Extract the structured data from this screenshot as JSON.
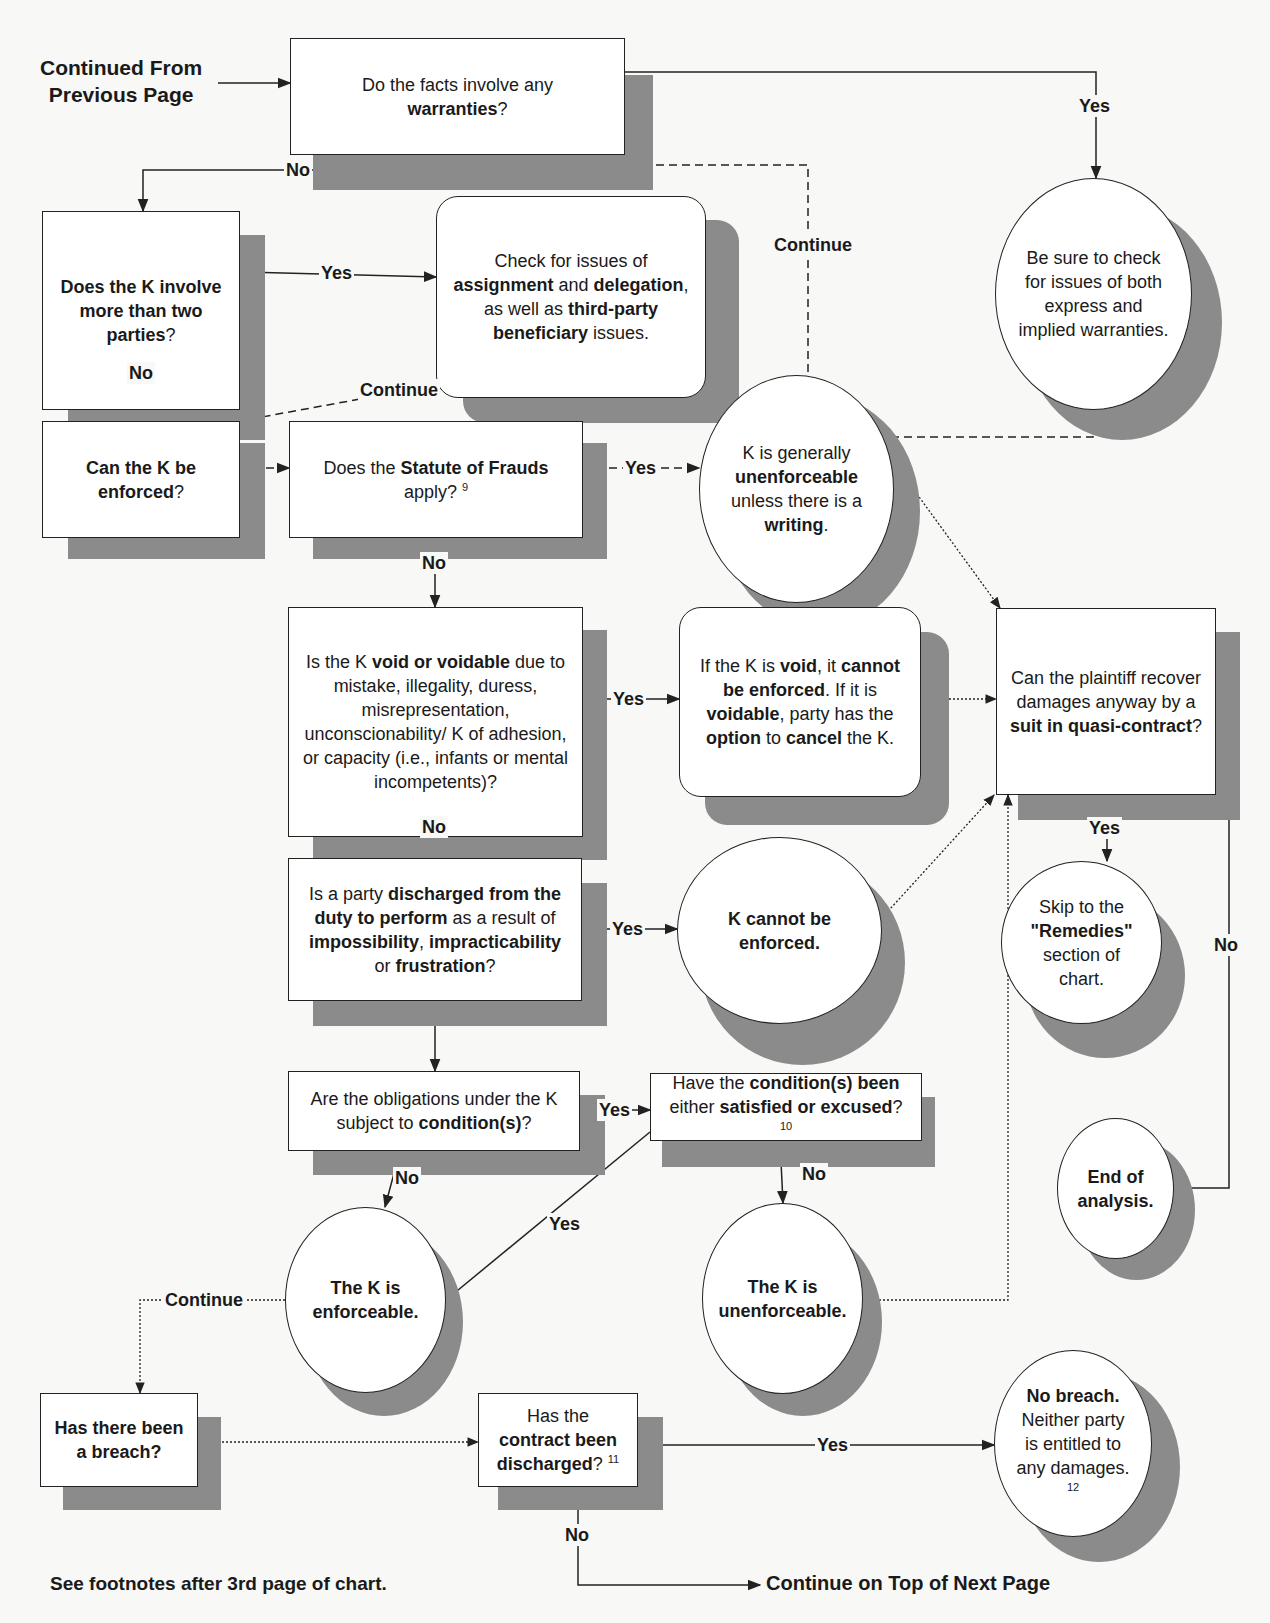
{
  "page": {
    "continued_from": [
      "Continued From",
      "Previous Page"
    ],
    "footnote_note": "See footnotes after 3rd page of chart.",
    "continue_next": "Continue on Top of Next Page"
  },
  "nodes": [
    {
      "id": "warranties",
      "shape": "rect",
      "x": 290,
      "y": 38,
      "w": 335,
      "h": 117,
      "sx": 313,
      "sy": 75,
      "sw": 340,
      "sh": 115,
      "segments": [
        [
          "",
          "Do the facts involve any "
        ],
        [
          "br",
          ""
        ],
        [
          "b",
          "warranties"
        ],
        [
          "",
          "?"
        ]
      ]
    },
    {
      "id": "check-warranties",
      "shape": "circle",
      "x": 995,
      "y": 178,
      "w": 197,
      "h": 232,
      "sx": 1022,
      "sy": 205,
      "sw": 200,
      "sh": 235,
      "segments": [
        [
          "",
          "Be sure to check for issues of both express and implied warranties."
        ]
      ]
    },
    {
      "id": "more-than-two-parties",
      "shape": "rect",
      "x": 42,
      "y": 211,
      "w": 198,
      "h": 199,
      "sx": 68,
      "sy": 235,
      "sw": 197,
      "sh": 205,
      "segments": [
        [
          "b",
          "Does the K involve more than two "
        ],
        [
          "b",
          "parties"
        ],
        [
          "",
          "?"
        ]
      ]
    },
    {
      "id": "assignment-delegation",
      "shape": "rounded",
      "x": 436,
      "y": 196,
      "w": 270,
      "h": 202,
      "sx": 463,
      "sy": 220,
      "sw": 276,
      "sh": 203,
      "segments": [
        [
          "",
          "Check for issues of "
        ],
        [
          "b",
          "assignment"
        ],
        [
          "",
          " and "
        ],
        [
          "b",
          "delegation"
        ],
        [
          "",
          ", as well as "
        ],
        [
          "b",
          "third-party beneficiary"
        ],
        [
          "",
          " issues."
        ]
      ]
    },
    {
      "id": "can-k-be-enforced",
      "shape": "rect",
      "x": 42,
      "y": 421,
      "w": 198,
      "h": 117,
      "sx": 68,
      "sy": 443,
      "sw": 197,
      "sh": 116,
      "segments": [
        [
          "b",
          "Can the K be enforced"
        ],
        [
          "",
          "?"
        ]
      ]
    },
    {
      "id": "statute-of-frauds",
      "shape": "rect",
      "x": 289,
      "y": 421,
      "w": 294,
      "h": 117,
      "sx": 313,
      "sy": 443,
      "sw": 294,
      "sh": 116,
      "segments": [
        [
          "",
          "Does the "
        ],
        [
          "b",
          "Statute of Frauds"
        ],
        [
          "",
          " apply? "
        ],
        [
          "sup",
          "9"
        ]
      ]
    },
    {
      "id": "generally-unenforceable",
      "shape": "circle",
      "x": 699,
      "y": 375,
      "w": 195,
      "h": 228,
      "sx": 720,
      "sy": 395,
      "sw": 200,
      "sh": 233,
      "segments": [
        [
          "",
          "K is generally "
        ],
        [
          "b",
          "unenforceable"
        ],
        [
          "",
          " unless there is a "
        ],
        [
          "b",
          "writing"
        ],
        [
          "",
          "."
        ]
      ]
    },
    {
      "id": "void-voidable",
      "shape": "rect",
      "x": 288,
      "y": 607,
      "w": 295,
      "h": 230,
      "sx": 313,
      "sy": 630,
      "sw": 294,
      "sh": 230,
      "segments": [
        [
          "",
          "Is the K "
        ],
        [
          "b",
          "void or voidable"
        ],
        [
          "",
          " due to mistake, illegality, duress, misrepresentation, unconscionability/ K of adhesion, or capacity (i.e., infants or mental incompetents)?"
        ]
      ]
    },
    {
      "id": "void-outcome",
      "shape": "rounded",
      "x": 679,
      "y": 607,
      "w": 242,
      "h": 190,
      "sx": 705,
      "sy": 632,
      "sw": 244,
      "sh": 193,
      "segments": [
        [
          "",
          "If the K is "
        ],
        [
          "b",
          "void"
        ],
        [
          "",
          ", it "
        ],
        [
          "b",
          "cannot be enforced"
        ],
        [
          "",
          ". If it is "
        ],
        [
          "b",
          "voidable"
        ],
        [
          "",
          ", party has the "
        ],
        [
          "b",
          "option"
        ],
        [
          "",
          " to "
        ],
        [
          "b",
          "cancel"
        ],
        [
          "",
          " the K."
        ]
      ]
    },
    {
      "id": "quasi-contract",
      "shape": "rect",
      "x": 996,
      "y": 608,
      "w": 220,
      "h": 187,
      "sx": 1018,
      "sy": 632,
      "sw": 222,
      "sh": 188,
      "segments": [
        [
          "",
          "Can the plaintiff recover damages anyway by a "
        ],
        [
          "b",
          "suit in quasi-contract"
        ],
        [
          "",
          "?"
        ]
      ]
    },
    {
      "id": "discharged-duty",
      "shape": "rect",
      "x": 288,
      "y": 858,
      "w": 294,
      "h": 143,
      "sx": 313,
      "sy": 883,
      "sw": 294,
      "sh": 143,
      "segments": [
        [
          "",
          "Is a party "
        ],
        [
          "b",
          "discharged from the duty to perform"
        ],
        [
          "",
          " as a result of "
        ],
        [
          "b",
          "impossibility"
        ],
        [
          "",
          ", "
        ],
        [
          "b",
          "impracticability"
        ],
        [
          "",
          " or "
        ],
        [
          "b",
          "frustration"
        ],
        [
          "",
          "?"
        ]
      ]
    },
    {
      "id": "cannot-be-enforced",
      "shape": "circle",
      "x": 677,
      "y": 837,
      "w": 205,
      "h": 187,
      "sx": 700,
      "sy": 860,
      "sw": 205,
      "sh": 205,
      "segments": [
        [
          "b",
          "K cannot be enforced."
        ]
      ]
    },
    {
      "id": "remedies",
      "shape": "circle",
      "x": 1001,
      "y": 861,
      "w": 161,
      "h": 163,
      "sx": 1025,
      "sy": 893,
      "sw": 160,
      "sh": 165,
      "segments": [
        [
          "",
          "Skip to the "
        ],
        [
          "b",
          "\"Remedies\""
        ],
        [
          "",
          " section of chart."
        ]
      ]
    },
    {
      "id": "conditions",
      "shape": "rect",
      "x": 288,
      "y": 1071,
      "w": 292,
      "h": 80,
      "sx": 313,
      "sy": 1095,
      "sw": 292,
      "sh": 80,
      "segments": [
        [
          "",
          "Are the obligations under the K subject to "
        ],
        [
          "b",
          "condition(s)"
        ],
        [
          "",
          "?"
        ]
      ]
    },
    {
      "id": "conditions-satisfied",
      "shape": "rect",
      "x": 650,
      "y": 1073,
      "w": 272,
      "h": 68,
      "sx": 662,
      "sy": 1097,
      "sw": 273,
      "sh": 70,
      "segments": [
        [
          "",
          "Have the "
        ],
        [
          "b",
          "condition(s) been"
        ],
        [
          "",
          " either "
        ],
        [
          "b",
          "satisfied or excused"
        ],
        [
          "",
          "? "
        ],
        [
          "sup",
          "10"
        ]
      ]
    },
    {
      "id": "end-of-analysis",
      "shape": "circle",
      "x": 1057,
      "y": 1118,
      "w": 117,
      "h": 141,
      "sx": 1078,
      "sy": 1140,
      "sw": 117,
      "sh": 140,
      "segments": [
        [
          "b",
          "End of analysis."
        ]
      ]
    },
    {
      "id": "k-enforceable",
      "shape": "circle",
      "x": 285,
      "y": 1207,
      "w": 161,
      "h": 186,
      "sx": 305,
      "sy": 1228,
      "sw": 158,
      "sh": 188,
      "segments": [
        [
          "b",
          "The K is enforceable."
        ]
      ]
    },
    {
      "id": "k-unenforceable",
      "shape": "circle",
      "x": 702,
      "y": 1203,
      "w": 161,
      "h": 191,
      "sx": 724,
      "sy": 1228,
      "sw": 158,
      "sh": 188,
      "segments": [
        [
          "b",
          "The K is unenforceable."
        ]
      ]
    },
    {
      "id": "breach",
      "shape": "rect",
      "x": 40,
      "y": 1393,
      "w": 158,
      "h": 94,
      "sx": 63,
      "sy": 1417,
      "sw": 158,
      "sh": 93,
      "segments": [
        [
          "b",
          "Has there been a breach?"
        ]
      ]
    },
    {
      "id": "contract-discharged",
      "shape": "rect",
      "x": 478,
      "y": 1393,
      "w": 160,
      "h": 94,
      "sx": 498,
      "sy": 1417,
      "sw": 165,
      "sh": 93,
      "segments": [
        [
          "",
          "Has the "
        ],
        [
          "b",
          "contract been discharged"
        ],
        [
          "",
          "? "
        ],
        [
          "sup",
          "11"
        ]
      ]
    },
    {
      "id": "no-breach",
      "shape": "circle",
      "x": 994,
      "y": 1350,
      "w": 158,
      "h": 187,
      "sx": 1018,
      "sy": 1372,
      "sw": 162,
      "sh": 190,
      "segments": [
        [
          "b",
          "No breach."
        ],
        [
          "",
          " Neither party is entitled to any damages. "
        ],
        [
          "sup",
          "12"
        ]
      ]
    }
  ],
  "edges": [
    {
      "id": "from-prev",
      "style": "solid",
      "arrow": "end",
      "points": [
        [
          218,
          83
        ],
        [
          290,
          83
        ]
      ]
    },
    {
      "id": "warranties-yes",
      "style": "solid",
      "arrow": "end",
      "points": [
        [
          625,
          72
        ],
        [
          1096,
          72
        ],
        [
          1096,
          178
        ]
      ]
    },
    {
      "id": "warranties-no",
      "style": "solid",
      "arrow": "end",
      "points": [
        [
          457,
          155
        ],
        [
          457,
          170
        ],
        [
          143,
          170
        ],
        [
          143,
          211
        ]
      ]
    },
    {
      "id": "warranty-continue",
      "style": "dashed",
      "arrow": "end",
      "points": [
        [
          1093,
          410
        ],
        [
          1093,
          437
        ],
        [
          808,
          437
        ],
        [
          808,
          165
        ],
        [
          457,
          165
        ]
      ]
    },
    {
      "id": "parties-yes",
      "style": "solid",
      "arrow": "end",
      "points": [
        [
          240,
          272
        ],
        [
          436,
          277
        ]
      ]
    },
    {
      "id": "parties-no",
      "style": "solid",
      "arrow": "end",
      "points": [
        [
          143,
          410
        ],
        [
          143,
          421
        ]
      ]
    },
    {
      "id": "assign-continue",
      "style": "dashed",
      "arrow": "end",
      "points": [
        [
          475,
          378
        ],
        [
          240,
          421
        ]
      ]
    },
    {
      "id": "enforce-to-sof",
      "style": "dashed",
      "arrow": "end",
      "points": [
        [
          240,
          468
        ],
        [
          289,
          468
        ]
      ]
    },
    {
      "id": "sof-yes",
      "style": "dashed",
      "arrow": "end",
      "points": [
        [
          583,
          468
        ],
        [
          699,
          468
        ]
      ]
    },
    {
      "id": "sof-no",
      "style": "solid",
      "arrow": "end",
      "points": [
        [
          435,
          538
        ],
        [
          435,
          607
        ]
      ]
    },
    {
      "id": "writing-to-quasi",
      "style": "dotted",
      "arrow": "end",
      "points": [
        [
          898,
          468
        ],
        [
          1000,
          608
        ]
      ]
    },
    {
      "id": "void-yes",
      "style": "solid",
      "arrow": "end",
      "points": [
        [
          583,
          699
        ],
        [
          679,
          699
        ]
      ]
    },
    {
      "id": "void-to-quasi",
      "style": "dotted",
      "arrow": "end",
      "points": [
        [
          941,
          699
        ],
        [
          996,
          699
        ]
      ]
    },
    {
      "id": "void-no",
      "style": "solid",
      "arrow": "end",
      "points": [
        [
          435,
          837
        ],
        [
          435,
          858
        ]
      ]
    },
    {
      "id": "discharge-yes",
      "style": "solid",
      "arrow": "end",
      "points": [
        [
          582,
          929
        ],
        [
          677,
          929
        ]
      ]
    },
    {
      "id": "cannot-to-quasi",
      "style": "dotted",
      "arrow": "end",
      "points": [
        [
          880,
          920
        ],
        [
          994,
          795
        ]
      ]
    },
    {
      "id": "quasi-yes",
      "style": "solid",
      "arrow": "end",
      "points": [
        [
          1107,
          795
        ],
        [
          1107,
          861
        ]
      ]
    },
    {
      "id": "quasi-no",
      "style": "solid",
      "arrow": "end",
      "points": [
        [
          1216,
          700
        ],
        [
          1229,
          700
        ],
        [
          1229,
          1188
        ],
        [
          1174,
          1188
        ]
      ]
    },
    {
      "id": "discharge-no",
      "style": "solid",
      "arrow": "end",
      "points": [
        [
          435,
          1001
        ],
        [
          435,
          1071
        ]
      ]
    },
    {
      "id": "conditions-yes",
      "style": "solid",
      "arrow": "end",
      "points": [
        [
          580,
          1110
        ],
        [
          650,
          1110
        ]
      ]
    },
    {
      "id": "conditions-no",
      "style": "solid",
      "arrow": "end",
      "points": [
        [
          400,
          1151
        ],
        [
          385,
          1207
        ]
      ]
    },
    {
      "id": "satisfied-yes",
      "style": "solid",
      "arrow": "end",
      "points": [
        [
          650,
          1132
        ],
        [
          446,
          1300
        ]
      ]
    },
    {
      "id": "satisfied-no",
      "style": "solid",
      "arrow": "end",
      "points": [
        [
          780,
          1141
        ],
        [
          783,
          1203
        ]
      ]
    },
    {
      "id": "unenforceable-to-quasi",
      "style": "dotted",
      "arrow": "end",
      "points": [
        [
          863,
          1300
        ],
        [
          1008,
          1300
        ],
        [
          1008,
          795
        ]
      ]
    },
    {
      "id": "enforceable-continue",
      "style": "dotted",
      "arrow": "end",
      "points": [
        [
          285,
          1300
        ],
        [
          140,
          1300
        ],
        [
          140,
          1393
        ]
      ]
    },
    {
      "id": "breach-to-discharged",
      "style": "dotted",
      "arrow": "end",
      "points": [
        [
          198,
          1442
        ],
        [
          478,
          1442
        ]
      ]
    },
    {
      "id": "discharged-yes",
      "style": "solid",
      "arrow": "end",
      "points": [
        [
          638,
          1445
        ],
        [
          994,
          1445
        ]
      ]
    },
    {
      "id": "discharged-no",
      "style": "solid",
      "arrow": "end",
      "points": [
        [
          578,
          1487
        ],
        [
          578,
          1585
        ],
        [
          760,
          1585
        ]
      ]
    }
  ],
  "edge_labels": [
    {
      "id": "warranties-yes",
      "text": "Yes",
      "x": 1077,
      "y": 95
    },
    {
      "id": "warranties-no",
      "text": "No",
      "x": 284,
      "y": 159
    },
    {
      "id": "warranty-continue",
      "text": "Continue",
      "x": 772,
      "y": 234
    },
    {
      "id": "parties-yes",
      "text": "Yes",
      "x": 319,
      "y": 262
    },
    {
      "id": "parties-no",
      "text": "No",
      "x": 127,
      "y": 362
    },
    {
      "id": "assign-continue",
      "text": "Continue",
      "x": 358,
      "y": 379
    },
    {
      "id": "sof-yes",
      "text": "Yes",
      "x": 623,
      "y": 457
    },
    {
      "id": "sof-no",
      "text": "No",
      "x": 420,
      "y": 552
    },
    {
      "id": "void-yes",
      "text": "Yes",
      "x": 611,
      "y": 688
    },
    {
      "id": "void-no",
      "text": "No",
      "x": 420,
      "y": 816
    },
    {
      "id": "discharge-yes",
      "text": "Yes",
      "x": 610,
      "y": 918
    },
    {
      "id": "quasi-yes",
      "text": "Yes",
      "x": 1087,
      "y": 817
    },
    {
      "id": "quasi-no",
      "text": "No",
      "x": 1212,
      "y": 934
    },
    {
      "id": "conditions-yes",
      "text": "Yes",
      "x": 597,
      "y": 1099
    },
    {
      "id": "conditions-no",
      "text": "No",
      "x": 393,
      "y": 1167
    },
    {
      "id": "satisfied-yes",
      "text": "Yes",
      "x": 547,
      "y": 1213
    },
    {
      "id": "satisfied-no",
      "text": "No",
      "x": 800,
      "y": 1163
    },
    {
      "id": "enforceable-continue",
      "text": "Continue",
      "x": 163,
      "y": 1289
    },
    {
      "id": "discharged-yes",
      "text": "Yes",
      "x": 815,
      "y": 1434
    },
    {
      "id": "discharged-no",
      "text": "No",
      "x": 563,
      "y": 1524
    }
  ],
  "colors": {
    "shadow": "#8b8b8b",
    "stroke": "#222222",
    "background": "#f8f8f6",
    "node_fill": "#ffffff"
  }
}
